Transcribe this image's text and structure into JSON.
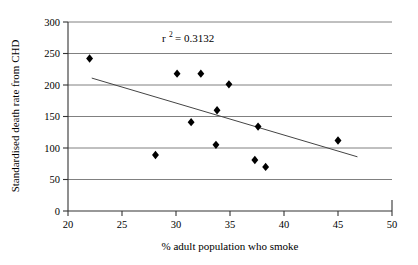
{
  "chart_data": {
    "type": "scatter",
    "title": "",
    "xlabel": "% adult population who smoke",
    "ylabel": "Standardised death rate from CHD",
    "xlim": [
      20,
      50
    ],
    "ylim": [
      0,
      300
    ],
    "xticks": [
      20,
      25,
      30,
      35,
      40,
      45,
      50
    ],
    "yticks": [
      0,
      50,
      100,
      150,
      200,
      250,
      300
    ],
    "grid": "horizontal",
    "legend": "none",
    "marker": "diamond",
    "marker_color": "#000000",
    "points": [
      {
        "x": 22.0,
        "y": 242
      },
      {
        "x": 28.1,
        "y": 89
      },
      {
        "x": 30.1,
        "y": 218
      },
      {
        "x": 31.4,
        "y": 141
      },
      {
        "x": 32.3,
        "y": 218
      },
      {
        "x": 33.7,
        "y": 105
      },
      {
        "x": 33.8,
        "y": 160
      },
      {
        "x": 34.9,
        "y": 201
      },
      {
        "x": 37.3,
        "y": 81
      },
      {
        "x": 37.6,
        "y": 134
      },
      {
        "x": 38.3,
        "y": 70
      },
      {
        "x": 45.0,
        "y": 112
      }
    ],
    "trendline": {
      "type": "linear",
      "x_start": 22.2,
      "y_start": 211,
      "x_end": 46.8,
      "y_end": 86
    },
    "annotations": [
      {
        "name": "r-squared",
        "prefix": "r",
        "superscript": "2",
        "suffix": "= 0.3132",
        "text": "r 2 = 0.3132",
        "x": 30.5,
        "y": 270
      }
    ]
  },
  "axes": {
    "x_tick_labels": [
      "20",
      "25",
      "30",
      "35",
      "40",
      "45",
      "50"
    ],
    "y_tick_labels": [
      "0",
      "50",
      "100",
      "150",
      "200",
      "250",
      "300"
    ],
    "x_axis_title": "% adult population who smoke",
    "y_axis_title": "Standardised death rate from CHD"
  },
  "colors": {
    "marker": "#000000",
    "axis": "#333333",
    "gridline": "#808080",
    "trendline": "#444444",
    "background": "#ffffff"
  }
}
